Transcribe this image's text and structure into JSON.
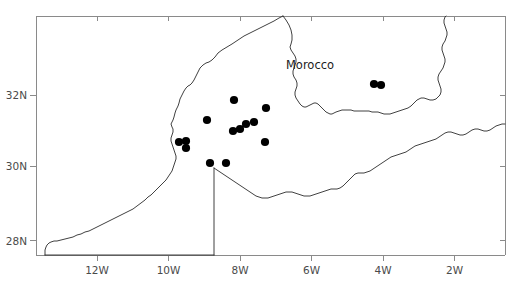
{
  "figure": {
    "label": "Morocco sampling site distribution map",
    "background_color": "#ffffff",
    "frame_color": "#8a8a8a",
    "coast_color": "#2b2b2b",
    "dot_color": "#000000"
  },
  "country_labels": [
    {
      "name": "morocco",
      "text": "Morocco",
      "x": 310,
      "y": 69
    }
  ],
  "axes": {
    "x_ticks": [
      {
        "label": "12W",
        "value": -12,
        "px": 97
      },
      {
        "label": "10W",
        "value": -10,
        "px": 168.5
      },
      {
        "label": "8W",
        "value": -8,
        "px": 240
      },
      {
        "label": "6W",
        "value": -6,
        "px": 311.5
      },
      {
        "label": "4W",
        "value": -4,
        "px": 383
      },
      {
        "label": "2W",
        "value": -2,
        "px": 454.5
      }
    ],
    "y_ticks": [
      {
        "label": "32N",
        "value": 32,
        "px": 95
      },
      {
        "label": "30N",
        "value": 30,
        "px": 166
      },
      {
        "label": "28N",
        "value": 28,
        "px": 240.5
      }
    ],
    "frame": {
      "left": 36,
      "right": 505,
      "top": 16,
      "bottom": 255
    },
    "x_range": [
      -13.6,
      -0.6
    ],
    "y_range": [
      27.6,
      34.0
    ],
    "grid": false
  },
  "chart_data": {
    "type": "scatter",
    "title": "",
    "xlabel": "",
    "ylabel": "",
    "series": [
      {
        "name": "sampling-sites",
        "marker": "filled-circle",
        "color": "#000000",
        "radius": 4.1,
        "points": [
          {
            "x": 374,
            "y": 84
          },
          {
            "x": 381,
            "y": 85
          },
          {
            "x": 234,
            "y": 100
          },
          {
            "x": 266,
            "y": 108
          },
          {
            "x": 254,
            "y": 122
          },
          {
            "x": 246,
            "y": 124
          },
          {
            "x": 240,
            "y": 129
          },
          {
            "x": 233,
            "y": 131
          },
          {
            "x": 207,
            "y": 120
          },
          {
            "x": 265,
            "y": 142
          },
          {
            "x": 179,
            "y": 142
          },
          {
            "x": 186,
            "y": 141
          },
          {
            "x": 186,
            "y": 148
          },
          {
            "x": 210,
            "y": 163
          },
          {
            "x": 226,
            "y": 163
          }
        ]
      }
    ]
  },
  "geometry": {
    "atlantic_coast": "M 283,16 L 279,18 L 274,21 L 268,24 L 262,27 L 256,30 L 250,33 L 244,36 L 238,40 L 232,44 L 227,47 L 222,50 L 218,53 L 215,57 L 212,60 L 209,62 L 206,63 L 203,65 L 200,68 L 198,72 L 196,76 L 194,80 L 192,83 L 190,85 L 188,86 L 186,88 L 184,91 L 182,95 L 180,99 L 179,103 L 178,106 L 177,108 L 176,110 L 175,113 L 174,117 L 173,120 L 172,122 L 171,124 L 172,127 L 173,129 L 173,132 L 172,135 L 171,138 L 171,141 L 172,144 L 173,147 L 174,150 L 175,153 L 176,156 L 176,159 L 175,162 L 174,165 L 173,168 L 172,171 L 170,174 L 168,177 L 166,180 L 163,183 L 160,186 L 157,189 L 154,192 L 151,195 L 148,197 L 145,200 L 141,203 L 137,206 L 133,209 L 129,211 L 125,213 L 121,215 L 117,217 L 113,219 L 109,221 L 105,223 L 101,225 L 97,227 L 93,229 L 89,231 L 85,232 L 81,234 L 77,235 L 73,237 L 69,238 L 65,239 L 61,240 L 57,241 L 54,241 L 51,242 L 49,243 L 47,245 L 46,247 L 45,250 L 45,253 L 45,255",
    "algeria_border": "M 283,16 L 286,20 L 289,25 L 291,30 L 292,35 L 292,40 L 291,44 L 290,47 L 291,50 L 293,53 L 295,56 L 296,59 L 296,62 L 295,65 L 294,68 L 293,71 L 293,74 L 294,77 L 296,80 L 297,83 L 297,86 L 296,89 L 295,92 L 295,95 L 296,98 L 298,101 L 300,104 L 302,106 L 304,107 L 306,107 L 308,106 L 310,105 L 312,104 L 314,103 L 316,103 L 318,104 L 320,106 L 322,108 L 324,110 L 326,112 L 328,113 L 330,114 L 332,114 L 334,113 L 336,112 L 339,111 L 342,110 L 345,110 L 348,110 L 351,110 L 354,111 L 357,111 L 360,111 L 363,111 L 366,111 L 369,111 L 372,112 L 375,112 L 378,112 L 381,113 L 384,114 L 387,114 L 390,114 L 393,113 L 396,112 L 399,111 L 402,110 L 405,109 L 408,108 L 411,106 L 413,104 L 415,102 L 417,100 L 419,99 L 421,98 L 424,98 L 427,99 L 430,100 L 433,100 L 436,99 L 438,97 L 440,95 L 441,92 L 441,89 L 440,86 L 439,83 L 438,80 L 438,77 L 439,74 L 441,71 L 443,68 L 444,65 L 445,62 L 445,59 L 444,56 L 443,53 L 442,50 L 442,47 L 443,44 L 445,41 L 446,38 L 447,35 L 447,32 L 446,29 L 445,26 L 444,23 L 444,20 L 445,17 L 446,16",
    "sahara_border_east": "M 214,168 L 217,170 L 220,172 L 223,174 L 226,176 L 229,178 L 232,180 L 235,182 L 238,184 L 241,186 L 244,188 L 247,190 L 250,192 L 253,194 L 256,196 L 259,197 L 262,198 L 265,198 L 268,198 L 271,197 L 274,196 L 277,195 L 280,194 L 283,193 L 286,192 L 289,192 L 292,192 L 295,193 L 298,194 L 301,195 L 304,196 L 307,196 L 310,196 L 313,195 L 316,194 L 319,193 L 322,192 L 325,191 L 328,190 L 331,189 L 334,189 L 337,189 L 340,188 L 343,186 L 345,184 L 347,182 L 349,180 L 351,178 L 353,176 L 355,174 L 358,173 L 361,173 L 364,173 L 367,172 L 370,171 L 373,169 L 376,167 L 379,165 L 382,163 L 385,161 L 388,159 L 391,157 L 394,156 L 397,155 L 400,154 L 403,153 L 406,152 L 409,150 L 412,148 L 415,146 L 418,145 L 421,144 L 424,143 L 427,142 L 430,141 L 433,140 L 436,139 L 439,137 L 442,135 L 445,133 L 448,132 L 451,132 L 454,133 L 457,134 L 460,135 L 463,135 L 466,134 L 469,132 L 472,130 L 475,129 L 478,129 L 481,130 L 484,131 L 487,131 L 490,130 L 493,128 L 496,126 L 499,125 L 502,124 L 505,124",
    "western_sahara_line": "M 214,168 L 214,255",
    "western_sahara_south": "M 45,255 L 214,255"
  }
}
